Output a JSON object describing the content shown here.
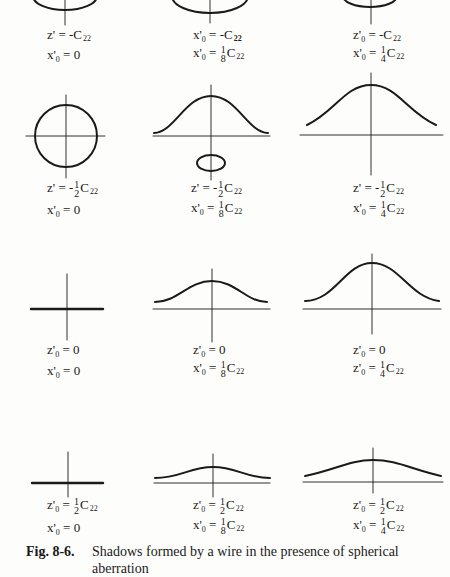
{
  "figure": {
    "number": "Fig. 8-6.",
    "caption_line1": "Shadows formed by a wire in the presence of spherical",
    "caption_line2": "aberration"
  },
  "panels": [
    {
      "row": 1,
      "col": 1,
      "shape": "ellipse (cut off at top)",
      "z_label": "z'",
      "z_value": "-C",
      "z_sub": "22",
      "x_label": "x'",
      "x_sub0": "0",
      "x_value": "0"
    },
    {
      "row": 1,
      "col": 2,
      "shape": "ellipse (cut off at top)",
      "z_label": "x'",
      "z_value": "-C",
      "z_sub": "22",
      "x_label": "x'",
      "x_frac_num": "1",
      "x_frac_den": "8",
      "x_value_suffix": "C",
      "x_sub": "22"
    },
    {
      "row": 1,
      "col": 3,
      "shape": "ellipse (cut off at top)",
      "z_label": "z'",
      "z_value": "-C",
      "z_sub": "22",
      "x_label": "x'",
      "x_frac_num": "1",
      "x_frac_den": "4",
      "x_value_suffix": "C",
      "x_sub": "22"
    },
    {
      "row": 2,
      "col": 1,
      "shape": "circle",
      "z_label": "z'",
      "z_frac_sign": "-",
      "z_frac_num": "1",
      "z_frac_den": "2",
      "z_suffix": "C",
      "z_sub": "22",
      "x_label": "x'",
      "x_value": "0"
    },
    {
      "row": 2,
      "col": 2,
      "shape": "bell curve + small ellipse below axis",
      "z_label": "z'",
      "z_frac_sign": "-",
      "z_frac_num": "1",
      "z_frac_den": "2",
      "z_suffix": "C",
      "z_sub": "22",
      "x_label": "x'",
      "x_frac_num": "1",
      "x_frac_den": "8",
      "x_value_suffix": "C",
      "x_sub": "22"
    },
    {
      "row": 2,
      "col": 3,
      "shape": "bell curve",
      "z_label": "z'",
      "z_frac_sign": "-",
      "z_frac_num": "1",
      "z_frac_den": "2",
      "z_suffix": "C",
      "z_sub": "22",
      "x_label": "x'",
      "x_frac_num": "1",
      "x_frac_den": "4",
      "x_value_suffix": "C",
      "x_sub": "22"
    },
    {
      "row": 3,
      "col": 1,
      "shape": "flat line",
      "z_label": "z'",
      "z_value": "0",
      "x_label": "x'",
      "x_value": "0"
    },
    {
      "row": 3,
      "col": 2,
      "shape": "bell curve",
      "z_label": "z'",
      "z_value": "0",
      "x_label": "x'",
      "x_frac_num": "1",
      "x_frac_den": "8",
      "x_value_suffix": "C",
      "x_sub": "22"
    },
    {
      "row": 3,
      "col": 3,
      "shape": "bell curve",
      "z_label": "z'",
      "z_value": "0",
      "x_label": "z'",
      "x_frac_num": "1",
      "x_frac_den": "4",
      "x_value_suffix": "C",
      "x_sub": "22"
    },
    {
      "row": 4,
      "col": 1,
      "shape": "flat line",
      "z_label": "z'",
      "z_frac_num": "1",
      "z_frac_den": "2",
      "z_suffix": "C",
      "z_sub": "22",
      "x_label": "x'",
      "x_value": "0"
    },
    {
      "row": 4,
      "col": 2,
      "shape": "low bell curve",
      "z_label": "z'",
      "z_frac_num": "1",
      "z_frac_den": "2",
      "z_suffix": "C",
      "z_sub": "22",
      "x_label": "x'",
      "x_frac_num": "1",
      "x_frac_den": "8",
      "x_value_suffix": "C",
      "x_sub": "22"
    },
    {
      "row": 4,
      "col": 3,
      "shape": "low bell curve",
      "z_label": "z'",
      "z_frac_num": "1",
      "z_frac_den": "2",
      "z_suffix": "C",
      "z_sub": "22",
      "x_label": "x'",
      "x_frac_num": "1",
      "x_frac_den": "4",
      "x_value_suffix": "C",
      "x_sub": "22"
    }
  ],
  "symbols": {
    "eq": "=",
    "minus": "-",
    "zero_sub": "0",
    "prime": "'"
  },
  "colors": {
    "ink": "#1a1a1a",
    "paper": "#fdfdfb"
  }
}
